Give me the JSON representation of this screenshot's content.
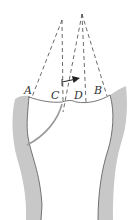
{
  "diagram": {
    "type": "anatomical-bone-diagram",
    "labels": {
      "A": "A",
      "B": "B",
      "C": "C",
      "D": "D"
    },
    "colors": {
      "cortex_fill": "#c8c8c8",
      "outline": "#555555",
      "dashed": "#444444",
      "fracture_line": "#9a9a9a",
      "arrow": "#222222",
      "background": "#ffffff"
    },
    "apexes": [
      {
        "name": "left-apex",
        "x": 62,
        "y": 20
      },
      {
        "name": "right-apex",
        "x": 82,
        "y": 14
      }
    ],
    "arrow": {
      "direction": "right"
    }
  }
}
